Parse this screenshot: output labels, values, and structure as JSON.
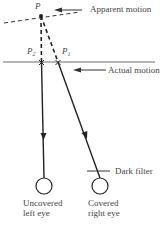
{
  "diagram": {
    "point_label": "P",
    "point_p1_label": "P",
    "point_p1_sub": "1",
    "point_p2_label": "P",
    "point_p2_sub": "2",
    "apparent_motion_label": "Apparent motion",
    "actual_motion_label": "Actual motion",
    "dark_filter_label": "Dark filter",
    "left_eye_label_line1": "Uncovered",
    "left_eye_label_line2": "left eye",
    "right_eye_label_line1": "Covered",
    "right_eye_label_line2": "right eye"
  }
}
